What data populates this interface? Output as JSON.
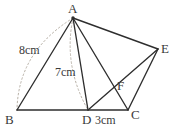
{
  "figure": {
    "type": "geometry-diagram",
    "width": 175,
    "height": 129,
    "background_color": "#ffffff",
    "stroke_color": "#2e2e2e",
    "arc_color": "#b9b2a8",
    "text_color": "#3a3a3a"
  },
  "vertices": [
    {
      "id": "A",
      "label": "A",
      "x": 73,
      "y": 18,
      "label_x": 68,
      "label_y": 2
    },
    {
      "id": "B",
      "label": "B",
      "x": 17,
      "y": 110,
      "label_x": 5,
      "label_y": 113
    },
    {
      "id": "C",
      "label": "C",
      "x": 128,
      "y": 110,
      "label_x": 131,
      "label_y": 108
    },
    {
      "id": "D",
      "label": "D",
      "x": 88,
      "y": 110,
      "label_x": 82,
      "label_y": 113
    },
    {
      "id": "E",
      "label": "E",
      "x": 158,
      "y": 49,
      "label_x": 161,
      "label_y": 42
    },
    {
      "id": "F",
      "label": "F",
      "x": 113,
      "y": 86,
      "label_x": 117,
      "label_y": 79
    }
  ],
  "segments": [
    {
      "name": "segment-A-B",
      "from": "A",
      "to": "B",
      "style": "solid"
    },
    {
      "name": "segment-B-C",
      "from": "B",
      "to": "C",
      "style": "solid"
    },
    {
      "name": "segment-A-D",
      "from": "A",
      "to": "D",
      "style": "solid"
    },
    {
      "name": "segment-A-C",
      "from": "A",
      "to": "C",
      "style": "solid"
    },
    {
      "name": "segment-A-E",
      "from": "A",
      "to": "E",
      "style": "solid"
    },
    {
      "name": "segment-D-E",
      "from": "D",
      "to": "E",
      "style": "solid"
    },
    {
      "name": "segment-C-E",
      "from": "C",
      "to": "E",
      "style": "solid"
    }
  ],
  "arcs": [
    {
      "name": "arc-A-to-B",
      "from": "A",
      "to": "B",
      "style": "dotted",
      "control_x": 18,
      "control_y": 52
    },
    {
      "name": "arc-A-to-D",
      "from": "A",
      "to": "D",
      "style": "dotted",
      "control_x": 63,
      "control_y": 66
    }
  ],
  "measurements": [
    {
      "name": "length-label-ab",
      "text": "8cm",
      "x": 19,
      "y": 44
    },
    {
      "name": "length-label-ad",
      "text": "7cm",
      "x": 55,
      "y": 66
    },
    {
      "name": "length-label-dc",
      "text": "3cm",
      "x": 95,
      "y": 114
    }
  ]
}
